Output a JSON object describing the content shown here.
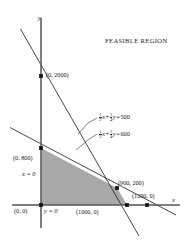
{
  "title": "FEASIBLE REGION",
  "axes": {
    "x_name": "x",
    "y_name": "y",
    "x_zero_label": "y = 0",
    "y_zero_label": "x = 0"
  },
  "equations": [
    {
      "id": "line-500",
      "num1": "1",
      "den1": "2",
      "var1": "x",
      "plus": "+",
      "num2": "1",
      "den2": "4",
      "var2": "y",
      "equals": "=",
      "rhs": "500",
      "full_text": "1/2 x + 1/4 y = 500"
    },
    {
      "id": "line-600",
      "num1": "1",
      "den1": "2",
      "var1": "x",
      "plus": "+",
      "num2": "3",
      "den2": "4",
      "var2": "y",
      "equals": "=",
      "rhs": "600",
      "full_text": "1/2 x + 3/4 y = 600"
    }
  ],
  "points": [
    {
      "id": "origin",
      "label": "(0, 0)",
      "x": 0,
      "y": 0
    },
    {
      "id": "y2000",
      "label": "(0, 2000)",
      "x": 0,
      "y": 2000
    },
    {
      "id": "y800",
      "label": "(0, 800)",
      "x": 0,
      "y": 800
    },
    {
      "id": "vertex",
      "label": "(900, 200)",
      "x": 900,
      "y": 200
    },
    {
      "id": "x1000",
      "label": "(1000, 0)",
      "x": 1000,
      "y": 0
    },
    {
      "id": "x1200",
      "label": "(1200, 0)",
      "x": 1200,
      "y": 0
    }
  ],
  "region": {
    "name": "feasible-region",
    "fill": "#a8a8a8",
    "vertices": [
      "(0, 0)",
      "(0, 800)",
      "(900, 200)",
      "(1000, 0)"
    ]
  },
  "colors": {
    "ink": "#1a1a1a",
    "axis": "#4a4a4a",
    "shade": "#a8a8a8",
    "background": "#ffffff"
  }
}
